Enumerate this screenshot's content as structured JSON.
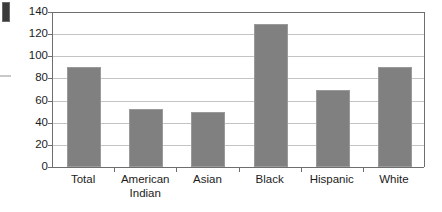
{
  "chart_data": {
    "type": "bar",
    "title": "",
    "subtitle": "",
    "xlabel": "",
    "ylabel": "",
    "categories": [
      "Total",
      "American\nIndian",
      "Asian",
      "Black",
      "Hispanic",
      "White"
    ],
    "values": [
      90,
      52,
      50,
      129,
      70,
      90
    ],
    "ylim": [
      0,
      140
    ],
    "ytick_labels": [
      "140",
      "120",
      "100",
      "80",
      "60",
      "40",
      "20",
      "0"
    ],
    "ytick_values": [
      140,
      120,
      100,
      80,
      60,
      40,
      20,
      0
    ],
    "grid": true,
    "grid_axis": "y",
    "legend": false,
    "legend_position": "none",
    "series": [
      {
        "name": "",
        "values": [
          90,
          52,
          50,
          129,
          70,
          90
        ]
      }
    ],
    "colors": {
      "bar_fill": "#808080",
      "bar_border": "#9a9a9a",
      "gridline": "#c4c4c4",
      "axis": "#6e6e6e",
      "text": "#1c1c1c",
      "background": "#ffffff"
    }
  },
  "artifacts": {
    "corner_block_label": "scan-artifact-block",
    "edge_dash_label": "scan-artifact-dash"
  }
}
